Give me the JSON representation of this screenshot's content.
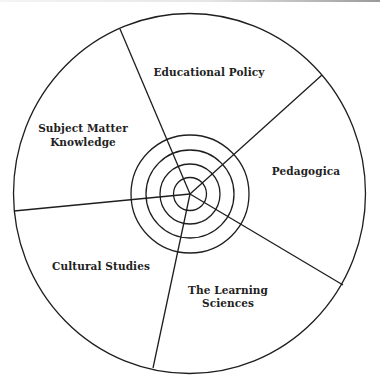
{
  "diagram": {
    "type": "segmented-circle-with-concentric-center",
    "colors": {
      "stroke": "#1e1e1e",
      "text": "#222222",
      "background": "#ffffff"
    },
    "segments": [
      {
        "id": "educational-policy",
        "lines": [
          "Educational Policy"
        ]
      },
      {
        "id": "pedagogica",
        "lines": [
          "Pedagogica"
        ]
      },
      {
        "id": "learning-sciences",
        "lines": [
          "The Learning",
          "Sciences"
        ]
      },
      {
        "id": "cultural-studies",
        "lines": [
          "Cultural Studies"
        ]
      },
      {
        "id": "subject-matter-knowledge",
        "lines": [
          "Subject Matter",
          "Knowledge"
        ]
      }
    ],
    "center_rings": 4
  }
}
